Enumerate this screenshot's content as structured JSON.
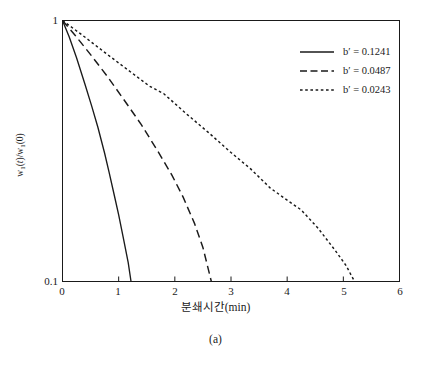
{
  "figure": {
    "caption": "(a)"
  },
  "axes": {
    "xlabel": "분쇄시간(min)",
    "ylabel_html": "w<sub>1</sub>(<i>t</i>)/w<sub>1</sub>(0)",
    "ylabel_text": "w1(t)/w1(0)",
    "xticks": [
      "0",
      "1",
      "2",
      "3",
      "4",
      "5",
      "6"
    ],
    "yticks": [
      "1",
      "0.1"
    ]
  },
  "legend": {
    "entries": [
      {
        "label": "b′ = 0.1241",
        "style": "solid"
      },
      {
        "label": "b′ = 0.0487",
        "style": "dashed"
      },
      {
        "label": "b′ = 0.0243",
        "style": "dotted"
      }
    ]
  },
  "chart_data": {
    "type": "line",
    "title": "",
    "subtitle": "",
    "caption": "(a)",
    "xlabel": "분쇄시간(min)",
    "ylabel": "w1(t)/w1(0)",
    "xlim": [
      0,
      6
    ],
    "ylim": [
      0.1,
      1
    ],
    "yscale": "log",
    "xscale": "linear",
    "grid": false,
    "legend_position": "top-right",
    "xticks": [
      0,
      1,
      2,
      3,
      4,
      5,
      6
    ],
    "yticks": [
      0.1,
      1
    ],
    "series": [
      {
        "name": "b′ = 0.1241",
        "style": "solid",
        "color": "#1a1a1a",
        "x": [
          0.0,
          0.12,
          0.25,
          0.4,
          0.52,
          0.63,
          0.75,
          0.83,
          0.92,
          1.0,
          1.08,
          1.17,
          1.22
        ],
        "y": [
          1.0,
          0.865,
          0.72,
          0.57,
          0.47,
          0.39,
          0.31,
          0.262,
          0.215,
          0.18,
          0.148,
          0.118,
          0.1
        ]
      },
      {
        "name": "b′ = 0.0487",
        "style": "dashed",
        "color": "#1a1a1a",
        "x": [
          0.0,
          0.22,
          0.5,
          0.8,
          1.1,
          1.4,
          1.7,
          1.95,
          2.15,
          2.35,
          2.5,
          2.65
        ],
        "y": [
          1.0,
          0.88,
          0.74,
          0.61,
          0.495,
          0.4,
          0.315,
          0.255,
          0.21,
          0.167,
          0.135,
          0.1
        ]
      },
      {
        "name": "b′ = 0.0243",
        "style": "dotted",
        "color": "#1a1a1a",
        "x": [
          0.0,
          0.35,
          0.75,
          1.15,
          1.55,
          1.8,
          2.2,
          2.6,
          3.0,
          3.35,
          3.7,
          4.0,
          4.25,
          4.55,
          4.85,
          5.05,
          5.2
        ],
        "y": [
          1.0,
          0.88,
          0.755,
          0.65,
          0.56,
          0.525,
          0.44,
          0.372,
          0.312,
          0.27,
          0.228,
          0.205,
          0.188,
          0.16,
          0.132,
          0.115,
          0.1
        ]
      }
    ]
  }
}
